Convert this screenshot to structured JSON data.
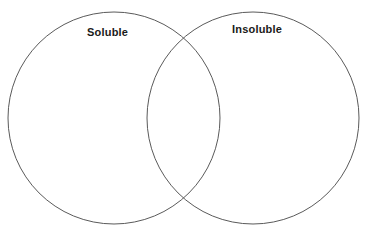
{
  "diagram": {
    "type": "venn-diagram",
    "title": "",
    "background_color": "#ffffff",
    "stroke_color": "#5a5a5a",
    "text_color": "#1a1a1a",
    "sets": [
      {
        "id": "left",
        "label": "Soluble",
        "center_x": 114,
        "center_y": 118,
        "radius": 106,
        "items": []
      },
      {
        "id": "right",
        "label": "Insoluble",
        "center_x": 253,
        "center_y": 118,
        "radius": 106,
        "items": []
      }
    ],
    "intersection": {
      "label": "",
      "items": []
    }
  }
}
